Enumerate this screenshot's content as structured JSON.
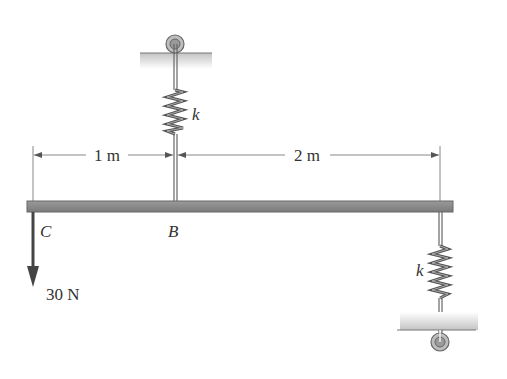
{
  "diagram": {
    "type": "beam-with-spring-supports",
    "beam": {
      "color": "#8a8a8a",
      "edge_color": "#6a6a6a"
    },
    "points": {
      "C": "C",
      "B": "B"
    },
    "springs": {
      "top_label": "k",
      "bottom_label": "k"
    },
    "dimensions": {
      "left": "1 m",
      "right": "2 m"
    },
    "load": {
      "label": "30 N",
      "direction": "down",
      "point": "C"
    },
    "colors": {
      "ink": "#333333",
      "ground_hatch": "#c8c8c8",
      "spring": "#555555",
      "dimension": "#777777"
    }
  }
}
